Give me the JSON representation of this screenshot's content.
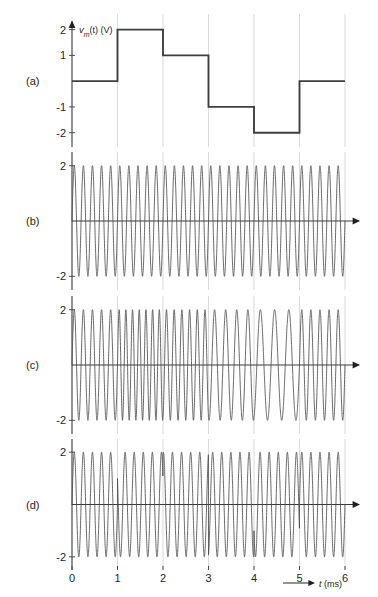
{
  "figure": {
    "panels": [
      {
        "label": "(a)",
        "kind": "message-step",
        "y_axis_title": "v",
        "y_axis_title_sub": "m",
        "y_axis_title_rest": "(t) (V)",
        "y_ticks": [
          {
            "value": 2,
            "label": "2"
          },
          {
            "value": 1,
            "label": "1"
          },
          {
            "value": -1,
            "label": "-1"
          },
          {
            "value": -2,
            "label": "-2"
          }
        ],
        "ylim": [
          -2.4,
          2.45
        ],
        "has_y_arrow": true,
        "has_x_arrow": false,
        "show_zero_axis": false
      },
      {
        "label": "(b)",
        "kind": "carrier",
        "y_ticks": [
          {
            "value": 2,
            "label": "2"
          },
          {
            "value": -2,
            "label": "-2"
          }
        ],
        "ylim": [
          -2.35,
          2.35
        ],
        "has_y_arrow": false,
        "has_x_arrow": true,
        "show_zero_axis": true
      },
      {
        "label": "(c)",
        "kind": "fm",
        "y_ticks": [
          {
            "value": 2,
            "label": "2"
          },
          {
            "value": -2,
            "label": "-2"
          }
        ],
        "ylim": [
          -2.35,
          2.35
        ],
        "has_y_arrow": false,
        "has_x_arrow": true,
        "show_zero_axis": true
      },
      {
        "label": "(d)",
        "kind": "pm",
        "y_ticks": [
          {
            "value": 2,
            "label": "2"
          },
          {
            "value": -2,
            "label": "-2"
          }
        ],
        "ylim": [
          -2.35,
          2.35
        ],
        "has_y_arrow": false,
        "has_x_arrow": true,
        "show_zero_axis": true
      }
    ],
    "x_axis": {
      "label_main": "t",
      "label_unit": "(ms)",
      "ticks": [
        {
          "value": 0,
          "label": "0"
        },
        {
          "value": 1,
          "label": "1"
        },
        {
          "value": 2,
          "label": "2"
        },
        {
          "value": 3,
          "label": "3"
        },
        {
          "value": 4,
          "label": "4"
        },
        {
          "value": 5,
          "label": "5"
        },
        {
          "value": 6,
          "label": "6"
        }
      ],
      "xlim": [
        0,
        6
      ]
    },
    "colors": {
      "ink": "#231f20",
      "grid": "#c9c9c9",
      "axis": "#3a3a3a",
      "wave": "#4e4e4e",
      "step": "#3f3f3f",
      "background": "#ffffff"
    }
  },
  "chart_data": {
    "type": "line",
    "title": "",
    "xlabel": "t (ms)",
    "ylabel": "v_m(t) (V)",
    "xlim": [
      0,
      6
    ],
    "grid": true,
    "legend": "none",
    "panels": [
      {
        "id": "a",
        "label": "(a)",
        "name": "message signal",
        "type": "step",
        "ylabel": "v_m(t) (V)",
        "ylim": [
          -2.4,
          2.45
        ],
        "yticks": [
          2,
          1,
          -1,
          -2
        ],
        "step_edges": [
          0,
          1,
          2,
          3,
          4,
          5,
          6
        ],
        "step_levels": [
          0,
          2,
          1,
          -1,
          -2,
          0
        ]
      },
      {
        "id": "b",
        "label": "(b)",
        "name": "unmodulated carrier",
        "type": "sine",
        "ylim": [
          -2.35,
          2.35
        ],
        "yticks": [
          2,
          -2
        ],
        "amplitude": 2,
        "frequency_cycles_per_ms": 5,
        "phase_deg": 0
      },
      {
        "id": "c",
        "label": "(c)",
        "name": "frequency modulated wave",
        "type": "fm",
        "ylim": [
          -2.35,
          2.35
        ],
        "yticks": [
          2,
          -2
        ],
        "amplitude": 2,
        "carrier_cycles_per_ms": 5,
        "deviation_cycles_per_ms_per_volt": 0.9,
        "segment_frequencies_cycles_per_ms": [
          5,
          6.8,
          5.9,
          4.1,
          3.2,
          5
        ]
      },
      {
        "id": "d",
        "label": "(d)",
        "name": "phase modulated wave",
        "type": "pm",
        "ylim": [
          -2.35,
          2.35
        ],
        "yticks": [
          2,
          -2
        ],
        "amplitude": 2,
        "frequency_cycles_per_ms": 5,
        "phase_deviation_deg_per_volt": 75,
        "segment_phase_deg": [
          0,
          150,
          75,
          -75,
          -150,
          0
        ]
      }
    ]
  }
}
